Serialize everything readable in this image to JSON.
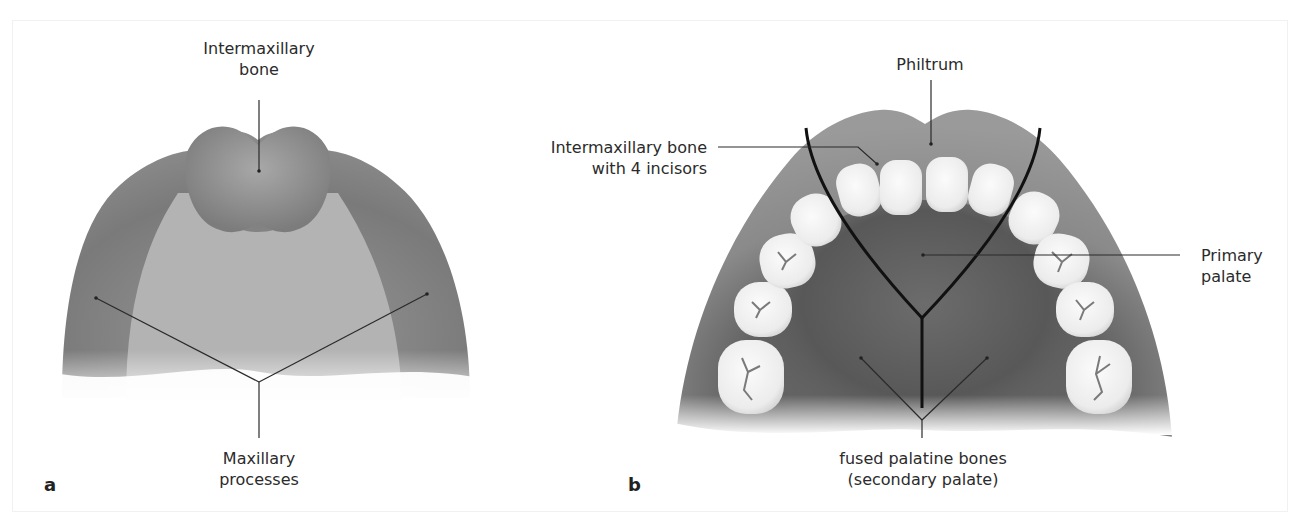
{
  "figure": {
    "panels": [
      {
        "letter": "a",
        "labels": {
          "intermaxillary_line1": "Intermaxillary",
          "intermaxillary_line2": "bone",
          "maxillary_line1": "Maxillary",
          "maxillary_line2": "processes"
        }
      },
      {
        "letter": "b",
        "labels": {
          "philtrum": "Philtrum",
          "incisors_line1": "Intermaxillary bone",
          "incisors_line2": "with 4 incisors",
          "primary_line1": "Primary",
          "primary_line2": "palate",
          "fused_line1": "fused palatine bones",
          "fused_line2": "(secondary palate)"
        }
      }
    ],
    "colors": {
      "tissue_dark": "#6e6e6e",
      "tissue_mid": "#8c8c8c",
      "tissue_light": "#b9b9b9",
      "palate_a": "#b3b3b3",
      "tooth": "#f4f4f4",
      "leader_line": "#2a2a2a",
      "suture_line": "#111111"
    }
  }
}
